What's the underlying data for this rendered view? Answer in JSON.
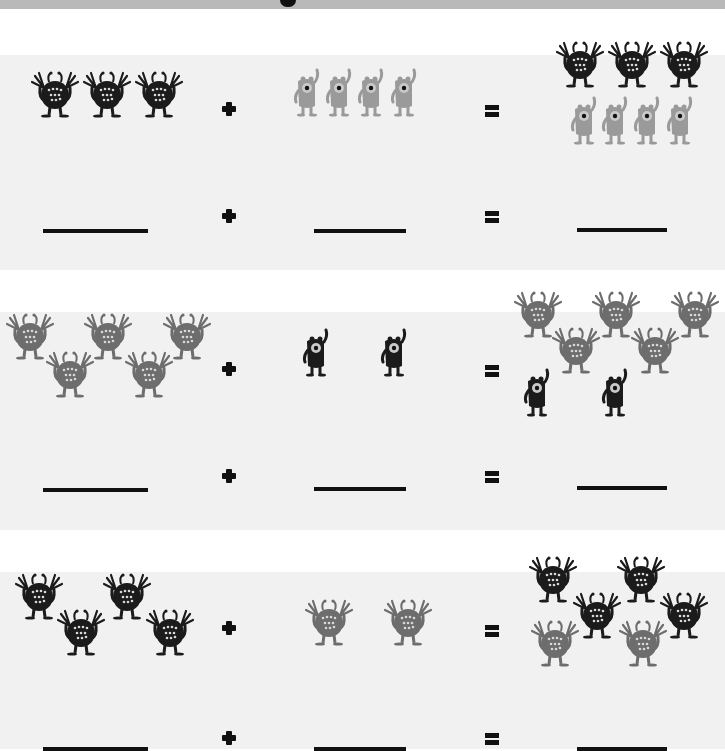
{
  "worksheet": {
    "type": "monster addition worksheet",
    "colors": {
      "black_monster": "#1b1b1b",
      "gray_monster": "#6d6d6d",
      "light_gray_monster": "#9a9a9a",
      "band_bg": "#f1f1f1",
      "header_bar": "#b9b9b9"
    },
    "problems": [
      {
        "left": {
          "count": 3,
          "monster": "black-fuzzy-monster"
        },
        "operator": "+",
        "right": {
          "count": 4,
          "monster": "light-gray-one-eyed-monster"
        },
        "equals": "=",
        "result": {
          "count": 7
        },
        "answer_blanks": [
          "",
          "",
          ""
        ]
      },
      {
        "left": {
          "count": 5,
          "monster": "gray-fuzzy-monster"
        },
        "operator": "+",
        "right": {
          "count": 2,
          "monster": "black-one-eyed-monster"
        },
        "equals": "=",
        "result": {
          "count": 7
        },
        "answer_blanks": [
          "",
          "",
          ""
        ]
      },
      {
        "left": {
          "count": 4,
          "monster": "black-fuzzy-monster"
        },
        "operator": "+",
        "right": {
          "count": 2,
          "monster": "gray-fuzzy-monster"
        },
        "equals": "=",
        "result": {
          "count": 6
        },
        "answer_blanks": [
          "",
          "",
          ""
        ]
      }
    ]
  }
}
